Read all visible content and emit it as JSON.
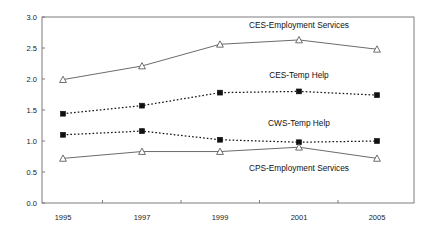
{
  "chart_data": {
    "type": "line",
    "title": "",
    "xlabel": "",
    "ylabel": "",
    "categories": [
      "1995",
      "1997",
      "1999",
      "2001",
      "2005"
    ],
    "ylim": [
      0.0,
      3.0
    ],
    "yticks": [
      "0.0",
      "0.5",
      "1.0",
      "1.5",
      "2.0",
      "2.5",
      "3.0"
    ],
    "ytick_values": [
      0.0,
      0.5,
      1.0,
      1.5,
      2.0,
      2.5,
      3.0
    ],
    "grid": false,
    "legend_position": "inline-annotations",
    "series": [
      {
        "name": "CES-Employment Services",
        "values": [
          1.99,
          2.21,
          2.56,
          2.63,
          2.48
        ],
        "style": "solid",
        "marker": "open-triangle",
        "color": "#5a5a5a",
        "label_x": 2001,
        "label_y": 2.82
      },
      {
        "name": "CES-Temp Help",
        "values": [
          1.44,
          1.57,
          1.78,
          1.8,
          1.74
        ],
        "style": "dotted",
        "marker": "filled-square",
        "color": "#111111",
        "label_x": 2001,
        "label_y": 2.02
      },
      {
        "name": "CWS-Temp Help",
        "values": [
          1.1,
          1.16,
          1.02,
          0.98,
          1.0
        ],
        "style": "dotted",
        "marker": "filled-square",
        "color": "#111111",
        "label_x": 2001,
        "label_y": 1.25
      },
      {
        "name": "CPS-Employment Services",
        "values": [
          0.72,
          0.83,
          0.83,
          0.9,
          0.72
        ],
        "style": "solid",
        "marker": "open-triangle",
        "color": "#5a5a5a",
        "label_x": 2001,
        "label_y": 0.52
      }
    ]
  }
}
